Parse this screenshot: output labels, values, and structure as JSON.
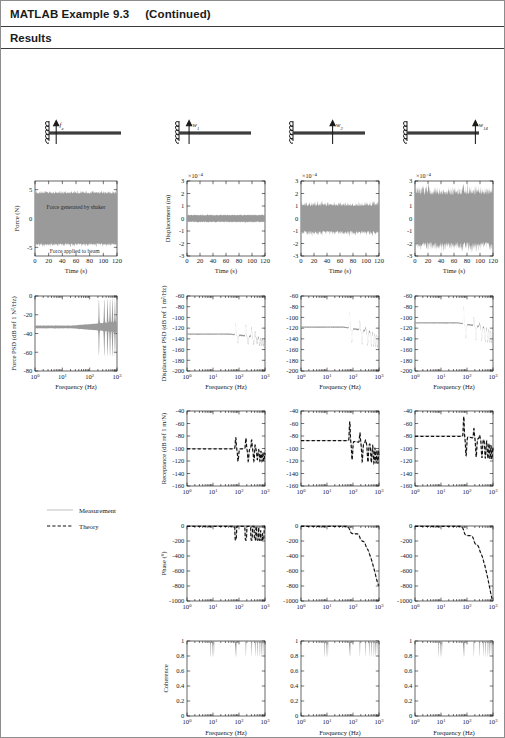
{
  "header": {
    "title": "MATLAB Example 9.3",
    "continued": "(Continued)",
    "section": "Results"
  },
  "legend": {
    "measurement_label": "Measurement",
    "theory_label": "Theory",
    "measurement_color": "#9a9a9a",
    "theory_color": "#111111"
  },
  "beams": [
    {
      "force_label": "f",
      "force_sub": "e",
      "arrow_pos_pct": 10
    },
    {
      "force_label": "w",
      "force_sub": "1",
      "arrow_pos_pct": 14
    },
    {
      "force_label": "w",
      "force_sub": "2",
      "arrow_pos_pct": 55
    },
    {
      "force_label": "w",
      "force_sub": "14",
      "arrow_pos_pct": 95
    }
  ],
  "chart_data": [
    {
      "id": "force-time",
      "type": "line",
      "title": "",
      "xlabel": "Time (s)",
      "ylabel": "Force (N)",
      "xticks": [
        0,
        20,
        40,
        60,
        80,
        100,
        120
      ],
      "yticks": [
        -5,
        0,
        5
      ],
      "xlim": [
        0,
        120
      ],
      "ylim": [
        -6.5,
        6.5
      ],
      "xscale": "linear",
      "noise_amplitude": 4.6,
      "series": [
        {
          "name": "Measurement",
          "style": "solid-gray"
        }
      ],
      "annotations": [
        {
          "text": "Force generated by shaker",
          "x": 60,
          "y": 1.6
        },
        {
          "text": "Force applied to beam",
          "x": 58,
          "y": -6.0
        }
      ]
    },
    {
      "id": "force-psd",
      "type": "line",
      "xlabel": "Frequency (Hz)",
      "ylabel": "Force PSD (dB ref 1 N²/Hz)",
      "xticks": [
        "10⁰",
        "10¹",
        "10²",
        "10³"
      ],
      "yticks": [
        -80,
        -60,
        -40,
        -20,
        0
      ],
      "ylim": [
        -80,
        0
      ],
      "xscale": "log",
      "baseline_db": -33,
      "series": [
        {
          "name": "Measurement",
          "style": "solid-gray"
        }
      ]
    },
    {
      "id": "displacement-time",
      "type": "line",
      "xlabel": "Time (s)",
      "ylabel": "Displacement (m)",
      "sci_exponent": "×10⁻⁴",
      "xticks": [
        0,
        20,
        40,
        60,
        80,
        100,
        120
      ],
      "yticks": [
        -3,
        -2,
        -1,
        0,
        1,
        2,
        3
      ],
      "xlim": [
        0,
        120
      ],
      "ylim": [
        -3,
        3
      ],
      "xscale": "linear",
      "columns": [
        {
          "column": 1,
          "noise_amplitude": 0.33
        },
        {
          "column": 2,
          "noise_amplitude": 1.35
        },
        {
          "column": 3,
          "noise_amplitude": 2.6
        }
      ]
    },
    {
      "id": "displacement-psd",
      "type": "line",
      "xlabel": "Frequency (Hz)",
      "ylabel": "Displacement PSD (dB ref 1 m²/Hz)",
      "xticks": [
        "10⁰",
        "10¹",
        "10²",
        "10³"
      ],
      "yticks": [
        -200,
        -180,
        -160,
        -140,
        -120,
        -100,
        -80,
        -60
      ],
      "ylim": [
        -200,
        -60
      ],
      "xscale": "log",
      "columns": [
        {
          "column": 1,
          "baseline_db": -131,
          "peaks_db": [
            -110,
            -111,
            -114,
            -121,
            -126,
            -131,
            -136,
            -141
          ]
        },
        {
          "column": 2,
          "baseline_db": -118,
          "peaks_db": [
            -87,
            -102,
            -112,
            -118,
            -124,
            -130,
            -136,
            -142
          ]
        },
        {
          "column": 3,
          "baseline_db": -110,
          "peaks_db": [
            -78,
            -95,
            -104,
            -110,
            -116,
            -122,
            -128,
            -134
          ]
        }
      ]
    },
    {
      "id": "receptance",
      "type": "line",
      "xlabel": "Frequency (Hz)",
      "ylabel": "Receptance (dB ref 1 m/N)",
      "xticks": [
        "10⁰",
        "10¹",
        "10²",
        "10³"
      ],
      "yticks": [
        -160,
        -140,
        -120,
        -100,
        -80,
        -60,
        -40
      ],
      "ylim": [
        -160,
        -40
      ],
      "xscale": "log",
      "columns": [
        {
          "column": 1,
          "baseline_db": -100,
          "peaks_db": [
            -82,
            -83,
            -86,
            -92,
            -97,
            -102,
            -107,
            -112
          ]
        },
        {
          "column": 2,
          "baseline_db": -87,
          "peaks_db": [
            -56,
            -72,
            -82,
            -88,
            -94,
            -100,
            -106,
            -112
          ]
        },
        {
          "column": 3,
          "baseline_db": -80,
          "peaks_db": [
            -48,
            -65,
            -74,
            -80,
            -86,
            -92,
            -98,
            -104
          ]
        }
      ],
      "series": [
        {
          "name": "Measurement",
          "style": "solid-gray"
        },
        {
          "name": "Theory",
          "style": "dashed-black"
        }
      ]
    },
    {
      "id": "phase",
      "type": "line",
      "xlabel": "Frequency (Hz)",
      "ylabel": "Phase (°)",
      "xticks": [
        "10⁰",
        "10¹",
        "10²",
        "10³"
      ],
      "yticks": [
        -1000,
        -800,
        -600,
        -400,
        -200,
        0
      ],
      "ylim": [
        -1000,
        0
      ],
      "xscale": "log",
      "columns": [
        {
          "column": 1,
          "description": "oscillating about 0 with dips to -180"
        },
        {
          "column": 2,
          "description": "staircase descending to about -700"
        },
        {
          "column": 3,
          "description": "staircase descending to about -1000"
        }
      ],
      "series": [
        {
          "name": "Measurement",
          "style": "solid-gray"
        },
        {
          "name": "Theory",
          "style": "dashed-black"
        }
      ]
    },
    {
      "id": "coherence",
      "type": "line",
      "xlabel": "Frequency (Hz)",
      "ylabel": "Coherence",
      "xticks": [
        "10⁰",
        "10¹",
        "10²",
        "10³"
      ],
      "yticks": [
        0,
        0.2,
        0.4,
        0.6,
        0.8,
        1
      ],
      "ylim": [
        0,
        1
      ],
      "xscale": "log",
      "baseline_value": 1.0,
      "series": [
        {
          "name": "Measurement",
          "style": "solid-gray"
        }
      ]
    }
  ]
}
